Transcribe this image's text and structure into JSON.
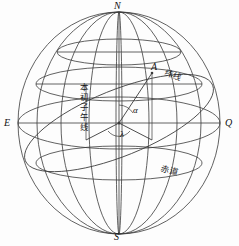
{
  "figure": {
    "type": "geometry-diagram",
    "background_color": "#fdfdfd",
    "line_color": "#3a3a3a",
    "text_color": "#111111"
  },
  "labels": {
    "north_pole": "N",
    "south_pole": "S",
    "east_point": "E",
    "right_point": "Q",
    "point_a": "A",
    "angle_alpha": "α",
    "angle_lambda": "λ",
    "latitude_line": "纬线",
    "prime_meridian": "本初子午线",
    "equator": "赤道"
  },
  "geometry": {
    "sphere": {
      "cx": 119,
      "cy": 123,
      "rx": 101,
      "ry": 111
    },
    "equator_ry": 26,
    "latitude_circle_ry": 17,
    "latitude_circle_cy": 84,
    "upper_small_circle_cy": 52,
    "meridian_rx_values": [
      101,
      68,
      35,
      4
    ],
    "point_a": {
      "x": 152,
      "y": 73
    },
    "center": {
      "x": 119,
      "y": 123
    }
  }
}
